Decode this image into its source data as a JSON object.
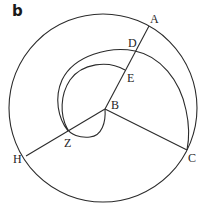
{
  "figure": {
    "panel_label": "b",
    "stroke_color": "#2b2b2b",
    "points": {
      "A": "A",
      "B": "B",
      "C": "C",
      "D": "D",
      "E": "E",
      "H": "H",
      "Z": "Z"
    }
  }
}
